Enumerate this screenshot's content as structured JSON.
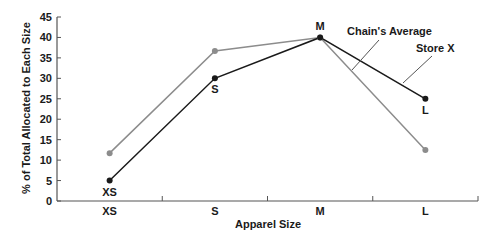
{
  "chart_data": {
    "type": "line",
    "title": "",
    "xlabel": "Apparel Size",
    "ylabel": "% of Total Allocated to Each Size",
    "categories": [
      "XS",
      "S",
      "M",
      "L"
    ],
    "ylim": [
      0,
      45
    ],
    "yticks": [
      "0",
      "5",
      "10",
      "15",
      "20",
      "25",
      "30",
      "35",
      "40",
      "45"
    ],
    "grid": false,
    "legend": "callout labels",
    "series": [
      {
        "name": "Chain's Average",
        "color": "#8c8c8c",
        "values": [
          11.7,
          36.7,
          40,
          12.5
        ]
      },
      {
        "name": "Store X",
        "color": "#1a1a1a",
        "values": [
          5,
          30,
          40,
          25
        ],
        "point_labels": [
          "XS",
          "S",
          "M",
          "L"
        ]
      }
    ],
    "annotations": [
      "Chain's Average",
      "Store X"
    ]
  }
}
